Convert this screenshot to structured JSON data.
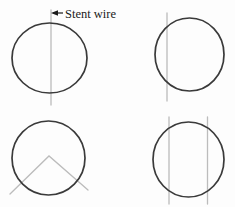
{
  "figure": {
    "label": {
      "text": "Stent wire",
      "icon": "left-arrow-icon"
    },
    "panels": [
      {
        "id": "top-left",
        "name": "single-center-wire",
        "wires": 1,
        "orientation": "vertical"
      },
      {
        "id": "top-right",
        "name": "single-offset-wire",
        "wires": 1,
        "orientation": "vertical"
      },
      {
        "id": "bottom-left",
        "name": "chevron-wires",
        "wires": 2,
        "orientation": "diagonal-v"
      },
      {
        "id": "bottom-right",
        "name": "double-parallel-wires",
        "wires": 2,
        "orientation": "vertical"
      }
    ]
  },
  "colors": {
    "background": "#fdfdfd",
    "ring": "#3a3a3a",
    "wire": "#bcbcbc",
    "label": "#1b1b1b"
  }
}
